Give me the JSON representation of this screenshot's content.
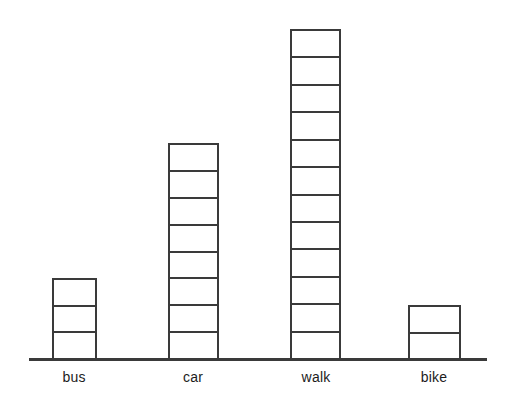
{
  "chart_data": {
    "type": "bar",
    "title": "",
    "subtitle": "",
    "xlabel": "",
    "ylabel": "",
    "categories": [
      "bus",
      "car",
      "walk",
      "bike"
    ],
    "values": [
      3,
      8,
      12,
      2
    ],
    "unit_label": "",
    "ylim": [
      0,
      12
    ],
    "grid": false,
    "legend": null,
    "annotations": []
  },
  "axis": {
    "baseline_color": "#3a3a3a",
    "baseline_left": 29,
    "baseline_right": 487,
    "baseline_y": 358
  },
  "style": {
    "stroke_color": "#3a3a3a",
    "fill_color": "#ffffff",
    "background": "#ffffff",
    "label_color": "#1c1c1c",
    "unit_height_px": 26.5,
    "bar_width_px": 47
  },
  "bars": [
    {
      "label": "bus",
      "units": 3,
      "left": 52,
      "width": 45,
      "top": 278
    },
    {
      "label": "car",
      "units": 8,
      "left": 168,
      "width": 51,
      "top": 143
    },
    {
      "label": "walk",
      "units": 12,
      "left": 290,
      "width": 51,
      "top": 29
    },
    {
      "label": "bike",
      "units": 2,
      "left": 408,
      "width": 53,
      "top": 305
    }
  ],
  "labels": [
    {
      "text": "bus",
      "center_x": 74,
      "y": 369
    },
    {
      "text": "car",
      "center_x": 193,
      "y": 369
    },
    {
      "text": "walk",
      "center_x": 316,
      "y": 369
    },
    {
      "text": "bike",
      "center_x": 434,
      "y": 369
    }
  ]
}
